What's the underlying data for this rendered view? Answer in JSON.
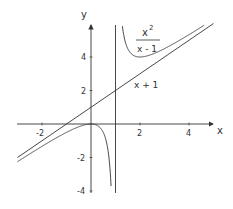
{
  "chart_data": {
    "type": "line",
    "title": "",
    "xlabel": "x",
    "ylabel": "y",
    "xlim": [
      -3,
      5
    ],
    "ylim": [
      -4,
      5.9
    ],
    "grid": false,
    "xticks": [
      -2,
      2,
      4
    ],
    "yticks": [
      -4,
      -2,
      2,
      4
    ],
    "series": [
      {
        "name": "x^2/(x-1)",
        "label_num": "x",
        "label_sup": "2",
        "label_den": "x - 1",
        "function": "x^2/(x-1)",
        "vertical_asymptote": 1,
        "oblique_asymptote": "x + 1"
      },
      {
        "name": "x + 1",
        "label": "x + 1",
        "function": "x+1"
      }
    ],
    "annotations": [
      {
        "type": "vline",
        "x": 1
      }
    ],
    "colors": {
      "curve": "#333333",
      "axis": "#333333"
    }
  }
}
